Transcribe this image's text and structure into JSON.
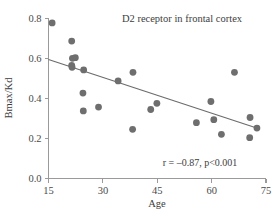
{
  "chart_data": {
    "type": "scatter",
    "title": "D2 receptor in frontal cortex",
    "xlabel": "Age",
    "ylabel": "Bmax/Kd",
    "xlim": [
      15,
      75
    ],
    "ylim": [
      0.0,
      0.8
    ],
    "grid": false,
    "legend": "none",
    "xticks": [
      "15",
      "30",
      "45",
      "60",
      "75"
    ],
    "xtick_values": [
      15,
      30,
      45,
      60,
      75
    ],
    "yticks": [
      "0.0",
      "0.2",
      "0.4",
      "0.6",
      "0.8"
    ],
    "ytick_values": [
      0.0,
      0.2,
      0.4,
      0.6,
      0.8
    ],
    "annotation": "r = –0.87, p<0.001",
    "correlation_r": -0.87,
    "p_value": "<0.001",
    "marker_color": "#6e6e6e",
    "line_color": "#6b6b6b",
    "axis_color": "#9a9a9a",
    "series": [
      {
        "name": "D2 receptor binding",
        "points": [
          [
            16.0,
            0.778
          ],
          [
            21.4,
            0.687
          ],
          [
            21.6,
            0.601
          ],
          [
            22.4,
            0.604
          ],
          [
            21.4,
            0.566
          ],
          [
            21.5,
            0.556
          ],
          [
            24.7,
            0.543
          ],
          [
            24.5,
            0.427
          ],
          [
            24.6,
            0.338
          ],
          [
            28.8,
            0.357
          ],
          [
            34.2,
            0.488
          ],
          [
            38.3,
            0.531
          ],
          [
            38.2,
            0.246
          ],
          [
            43.2,
            0.345
          ],
          [
            44.9,
            0.376
          ],
          [
            55.8,
            0.279
          ],
          [
            59.8,
            0.385
          ],
          [
            60.6,
            0.294
          ],
          [
            62.7,
            0.221
          ],
          [
            66.3,
            0.531
          ],
          [
            70.6,
            0.305
          ],
          [
            70.5,
            0.204
          ],
          [
            72.5,
            0.252
          ]
        ]
      }
    ],
    "trend_line": {
      "x_start": 15.0,
      "y_start": 0.595,
      "x_end": 72.0,
      "y_end": 0.255
    }
  }
}
